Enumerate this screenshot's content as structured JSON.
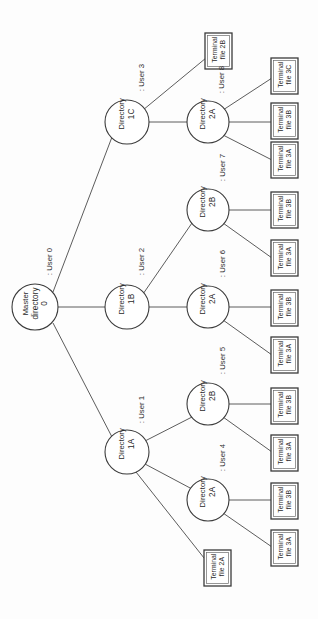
{
  "diagram": {
    "orientation": "rotated-90",
    "stroke_color": "#3b3b3b",
    "background_color": "#ffffff",
    "root": {
      "id": "master",
      "line1": "Master",
      "line2": "directory",
      "line3": "0",
      "cx": 35,
      "cy": 307,
      "r": 23
    },
    "level1": [
      {
        "id": "dir-1c",
        "line1": "Directory",
        "line2": "1C",
        "cx": 127,
        "cy": 122,
        "r": 22
      },
      {
        "id": "dir-1b",
        "line1": "Directory",
        "line2": "1B",
        "cx": 127,
        "cy": 307,
        "r": 22
      },
      {
        "id": "dir-1a",
        "line1": "Directory",
        "line2": "1A",
        "cx": 127,
        "cy": 452,
        "r": 22
      }
    ],
    "level2": [
      {
        "id": "dir-2a-u8",
        "line1": "Directory",
        "line2": "2A",
        "cx": 208,
        "cy": 122,
        "r": 21
      },
      {
        "id": "dir-2b-u7",
        "line1": "Directory",
        "line2": "2B",
        "cx": 208,
        "cy": 210,
        "r": 21
      },
      {
        "id": "dir-2a-u6",
        "line1": "Directory",
        "line2": "2A",
        "cx": 208,
        "cy": 307,
        "r": 21
      },
      {
        "id": "dir-2b-u5",
        "line1": "Directory",
        "line2": "2B",
        "cx": 208,
        "cy": 404,
        "r": 21
      },
      {
        "id": "dir-2a-u4",
        "line1": "Directory",
        "line2": "2A",
        "cx": 208,
        "cy": 500,
        "r": 21
      }
    ],
    "leaves": [
      {
        "id": "leaf-2b",
        "line1": "Terminal",
        "line2": "file 2B",
        "x": 205,
        "y": 33,
        "w": 27,
        "h": 36
      },
      {
        "id": "leaf-3c-top",
        "line1": "Terminal",
        "line2": "file 3C",
        "x": 271,
        "y": 58,
        "w": 27,
        "h": 36
      },
      {
        "id": "leaf-3b-1",
        "line1": "Terminal",
        "line2": "file 3B",
        "x": 271,
        "y": 103,
        "w": 27,
        "h": 36
      },
      {
        "id": "leaf-3a-1",
        "line1": "Terminal",
        "line2": "file 3A",
        "x": 271,
        "y": 142,
        "w": 27,
        "h": 36
      },
      {
        "id": "leaf-3b-2",
        "line1": "Terminal",
        "line2": "file 3B",
        "x": 271,
        "y": 192,
        "w": 27,
        "h": 36
      },
      {
        "id": "leaf-3a-2",
        "line1": "Terminal",
        "line2": "file 3A",
        "x": 271,
        "y": 240,
        "w": 27,
        "h": 36
      },
      {
        "id": "leaf-3b-3",
        "line1": "Terminal",
        "line2": "file 3B",
        "x": 271,
        "y": 290,
        "w": 27,
        "h": 36
      },
      {
        "id": "leaf-3a-3",
        "line1": "Terminal",
        "line2": "file 3A",
        "x": 271,
        "y": 337,
        "w": 27,
        "h": 36
      },
      {
        "id": "leaf-3b-4",
        "line1": "Terminal",
        "line2": "file 3B",
        "x": 271,
        "y": 388,
        "w": 27,
        "h": 36
      },
      {
        "id": "leaf-3a-4",
        "line1": "Terminal",
        "line2": "file 3A",
        "x": 271,
        "y": 435,
        "w": 27,
        "h": 36
      },
      {
        "id": "leaf-3b-5",
        "line1": "Terminal",
        "line2": "file 3B",
        "x": 271,
        "y": 483,
        "w": 27,
        "h": 36
      },
      {
        "id": "leaf-3a-5",
        "line1": "Terminal",
        "line2": "file 3A",
        "x": 271,
        "y": 530,
        "w": 27,
        "h": 36
      },
      {
        "id": "leaf-2a",
        "line1": "Terminal",
        "line2": "file 2A",
        "x": 204,
        "y": 550,
        "w": 27,
        "h": 36
      }
    ],
    "user_labels": [
      {
        "id": "user-0",
        "text": ": User 0",
        "x": 48,
        "y": 262
      },
      {
        "id": "user-3",
        "text": ": User 3",
        "x": 140,
        "y": 78
      },
      {
        "id": "user-2",
        "text": ": User 2",
        "x": 140,
        "y": 262
      },
      {
        "id": "user-1",
        "text": ": User 1",
        "x": 140,
        "y": 410
      },
      {
        "id": "user-8",
        "text": ": User 8",
        "x": 220,
        "y": 80
      },
      {
        "id": "user-7",
        "text": ": User 7",
        "x": 221,
        "y": 168
      },
      {
        "id": "user-6",
        "text": ": User 6",
        "x": 221,
        "y": 264
      },
      {
        "id": "user-5",
        "text": ": User 5",
        "x": 221,
        "y": 361
      },
      {
        "id": "user-4",
        "text": ": User 4",
        "x": 221,
        "y": 458
      }
    ],
    "edges": [
      {
        "from": "master",
        "to": "dir-1c",
        "x1": 53,
        "y1": 292,
        "x2": 112,
        "y2": 137
      },
      {
        "from": "master",
        "to": "dir-1b",
        "x1": 58,
        "y1": 307,
        "x2": 105,
        "y2": 307
      },
      {
        "from": "master",
        "to": "dir-1a",
        "x1": 53,
        "y1": 323,
        "x2": 112,
        "y2": 437
      },
      {
        "from": "dir-1c",
        "to": "leaf-2b",
        "x1": 143,
        "y1": 110,
        "x2": 206,
        "y2": 58
      },
      {
        "from": "dir-1c",
        "to": "dir-2a-u8",
        "x1": 149,
        "y1": 122,
        "x2": 187,
        "y2": 122
      },
      {
        "from": "dir-1b",
        "to": "dir-2b-u7",
        "x1": 143,
        "y1": 294,
        "x2": 192,
        "y2": 223
      },
      {
        "from": "dir-1b",
        "to": "dir-2a-u6",
        "x1": 149,
        "y1": 307,
        "x2": 187,
        "y2": 307
      },
      {
        "from": "dir-1a",
        "to": "dir-2b-u5",
        "x1": 145,
        "y1": 441,
        "x2": 192,
        "y2": 417
      },
      {
        "from": "dir-1a",
        "to": "dir-2a-u4",
        "x1": 145,
        "y1": 464,
        "x2": 192,
        "y2": 489
      },
      {
        "from": "dir-1a",
        "to": "leaf-2a",
        "x1": 136,
        "y1": 472,
        "x2": 208,
        "y2": 563
      },
      {
        "from": "dir-2a-u8",
        "to": "leaf-3c-top",
        "x1": 223,
        "y1": 110,
        "x2": 272,
        "y2": 78
      },
      {
        "from": "dir-2a-u8",
        "to": "leaf-3b-1",
        "x1": 229,
        "y1": 122,
        "x2": 271,
        "y2": 122
      },
      {
        "from": "dir-2a-u8",
        "to": "leaf-3a-1",
        "x1": 223,
        "y1": 135,
        "x2": 272,
        "y2": 160
      },
      {
        "from": "dir-2b-u7",
        "to": "leaf-3b-2",
        "x1": 229,
        "y1": 210,
        "x2": 271,
        "y2": 210
      },
      {
        "from": "dir-2b-u7",
        "to": "leaf-3a-2",
        "x1": 223,
        "y1": 223,
        "x2": 272,
        "y2": 258
      },
      {
        "from": "dir-2a-u6",
        "to": "leaf-3b-3",
        "x1": 229,
        "y1": 307,
        "x2": 271,
        "y2": 307
      },
      {
        "from": "dir-2a-u6",
        "to": "leaf-3a-3",
        "x1": 223,
        "y1": 320,
        "x2": 272,
        "y2": 355
      },
      {
        "from": "dir-2b-u5",
        "to": "leaf-3b-4",
        "x1": 229,
        "y1": 404,
        "x2": 271,
        "y2": 404
      },
      {
        "from": "dir-2b-u5",
        "to": "leaf-3a-4",
        "x1": 223,
        "y1": 417,
        "x2": 272,
        "y2": 452
      },
      {
        "from": "dir-2a-u4",
        "to": "leaf-3b-5",
        "x1": 229,
        "y1": 500,
        "x2": 271,
        "y2": 500
      },
      {
        "from": "dir-2a-u4",
        "to": "leaf-3a-5",
        "x1": 223,
        "y1": 513,
        "x2": 272,
        "y2": 547
      }
    ]
  }
}
